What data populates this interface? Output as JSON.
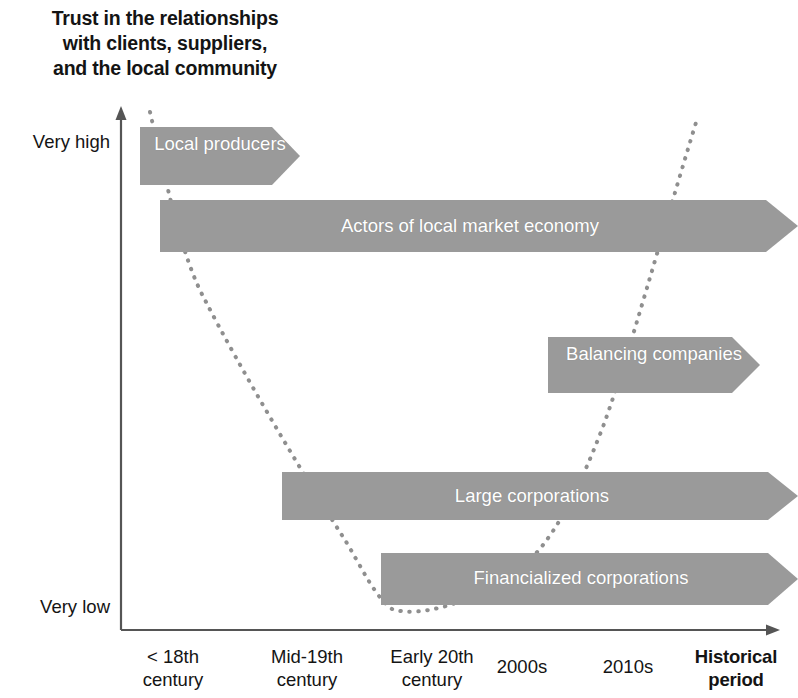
{
  "title": "Trust in the relationships\nwith clients, suppliers,\nand the local community",
  "colors": {
    "band_fill": "#9a9a9a",
    "band_text": "#ffffff",
    "axis": "#4a4a4a",
    "curve": "#8f8f8f",
    "text": "#141414"
  },
  "axes": {
    "y_axis_name": "Trust level",
    "y_ticks": [
      {
        "label": "Very high"
      },
      {
        "label": "Very low"
      }
    ],
    "x_axis_title": "Historical\nperiod",
    "x_ticks": [
      {
        "label": "< 18th\ncentury"
      },
      {
        "label": "Mid-19th\ncentury"
      },
      {
        "label": "Early 20th\ncentury"
      },
      {
        "label": "2000s"
      },
      {
        "label": "2010s"
      }
    ]
  },
  "chart_data": {
    "type": "diagram",
    "title": "Trust in the relationships with clients, suppliers, and the local community",
    "xlabel": "Historical period",
    "ylabel": "Trust in the relationships with clients, suppliers, and the local community",
    "x_categories": [
      "< 18th century",
      "Mid-19th century",
      "Early 20th century",
      "2000s",
      "2010s"
    ],
    "ylim": [
      "Very low",
      "Very high"
    ],
    "grid": false,
    "legend": "none",
    "bands": [
      {
        "label": "Local producers",
        "trust_level": "Very high",
        "start_period": "< 18th century",
        "end_period": "< 18th century",
        "x": 140,
        "y": 127,
        "width": 160,
        "height": 58,
        "tip": 28
      },
      {
        "label": "Actors of local market economy",
        "trust_level": "High",
        "start_period": "< 18th century",
        "end_period": "2010s",
        "x": 160,
        "y": 200,
        "width": 638,
        "height": 52,
        "tip": 32
      },
      {
        "label": "Balancing companies",
        "trust_level": "Medium",
        "start_period": "2000s",
        "end_period": "2010s",
        "x": 548,
        "y": 337,
        "width": 212,
        "height": 56,
        "tip": 28
      },
      {
        "label": "Large corporations",
        "trust_level": "Low",
        "start_period": "Mid-19th century",
        "end_period": "2010s",
        "x": 282,
        "y": 472,
        "width": 516,
        "height": 48,
        "tip": 30
      },
      {
        "label": "Financialized corporations",
        "trust_level": "Very low",
        "start_period": "Early 20th century",
        "end_period": "2010s",
        "x": 381,
        "y": 553,
        "width": 417,
        "height": 52,
        "tip": 30
      }
    ],
    "trust_curve": {
      "description": "Dotted U-shaped curve showing trust declining from very high in the pre-18th century to very low in the early 20th century, then recovering toward 2010s",
      "points": [
        [
          150,
          112
        ],
        [
          185,
          250
        ],
        [
          250,
          350
        ],
        [
          310,
          450
        ],
        [
          360,
          545
        ],
        [
          390,
          610
        ],
        [
          450,
          608
        ],
        [
          520,
          570
        ],
        [
          565,
          505
        ],
        [
          600,
          420
        ],
        [
          640,
          320
        ],
        [
          672,
          215
        ],
        [
          698,
          118
        ]
      ]
    }
  }
}
